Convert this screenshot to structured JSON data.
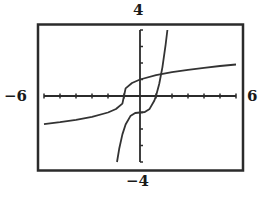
{
  "chart_data": {
    "type": "line",
    "title": "",
    "xlabel": "",
    "ylabel": "",
    "xlim": [
      -6,
      6
    ],
    "ylim": [
      -4,
      4
    ],
    "x_tick_step": 1,
    "y_tick_step": 1,
    "grid": false,
    "legend": null,
    "window_labels": {
      "xmin": "−6",
      "xmax": "6",
      "ymin": "−4",
      "ymax": "4"
    },
    "series": [
      {
        "name": "f(x) = cube root of (x + 1)",
        "x": [
          -6,
          -5,
          -4,
          -3,
          -2,
          -1.5,
          -1.1,
          -1,
          -0.9,
          -0.5,
          0,
          1,
          2,
          3,
          4,
          5,
          6
        ],
        "y": [
          -1.71,
          -1.59,
          -1.44,
          -1.26,
          -1.0,
          -0.79,
          -0.46,
          0,
          0.46,
          0.79,
          1.0,
          1.26,
          1.44,
          1.59,
          1.71,
          1.82,
          1.91
        ]
      },
      {
        "name": "g(x) = x^3 - 1",
        "x": [
          -1.44,
          -1.3,
          -1.1,
          -0.9,
          -0.6,
          -0.3,
          0,
          0.3,
          0.6,
          0.9,
          1.0,
          1.2,
          1.4,
          1.6,
          1.71
        ],
        "y": [
          -4.0,
          -3.2,
          -2.33,
          -1.73,
          -1.22,
          -1.03,
          -1.0,
          -0.97,
          -0.78,
          -0.27,
          0,
          0.73,
          1.74,
          3.1,
          4.0
        ]
      }
    ]
  },
  "colors": {
    "frame": "#2b2b2b",
    "axes": "#2b2b2b",
    "curve": "#333333",
    "background": "#ffffff"
  }
}
